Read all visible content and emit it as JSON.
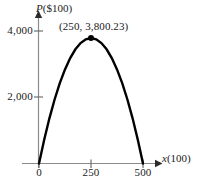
{
  "figure": {
    "background_color": "#ffffff",
    "curve_color": "#000000",
    "axis_color": "#8a8a8a",
    "text_color": "#1a1a1a"
  },
  "axis_titles": {
    "y_variable": "P",
    "y_units": "($100)",
    "x_variable": "x",
    "x_units": "(100)"
  },
  "annotations": {
    "vertex_label": "(250, 3,800.23)"
  },
  "chart_data": {
    "type": "line",
    "title": "",
    "xlabel": "x (100)",
    "ylabel": "P ($100)",
    "xlim": [
      0,
      560
    ],
    "ylim": [
      0,
      4400
    ],
    "grid": false,
    "legend": null,
    "xticks": [
      0,
      250,
      500
    ],
    "xticklabels": [
      "0",
      "250",
      "500"
    ],
    "yticks": [
      2000,
      4000
    ],
    "yticklabels": [
      "2,000",
      "4,000"
    ],
    "series": [
      {
        "name": "P(x)",
        "shape": "parabola",
        "roots": [
          0,
          500
        ],
        "vertex": [
          250,
          3800.23
        ],
        "x": [
          0,
          25,
          50,
          75,
          100,
          125,
          150,
          175,
          200,
          225,
          250,
          275,
          300,
          325,
          350,
          375,
          400,
          425,
          450,
          475,
          500
        ],
        "y": [
          0,
          722,
          1368,
          1938,
          2432,
          2850,
          3192,
          3458,
          3648,
          3762,
          3800.23,
          3762,
          3648,
          3458,
          3192,
          2850,
          2432,
          1938,
          1368,
          722,
          0
        ]
      }
    ],
    "markers": [
      {
        "name": "vertex-point",
        "x": 250,
        "y": 3800.23,
        "label": "(250, 3,800.23)"
      }
    ]
  }
}
